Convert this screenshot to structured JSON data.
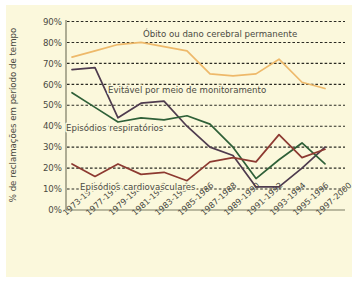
{
  "figure": {
    "background_color": "#fbf8dc",
    "border_color": "#ffffff"
  },
  "chart_data": {
    "type": "line",
    "title": "",
    "xlabel": "",
    "ylabel": "% de reclamações  em período de tempo",
    "ylim": [
      0,
      90
    ],
    "yticks": [
      0,
      10,
      20,
      30,
      40,
      50,
      60,
      70,
      80,
      90
    ],
    "ytick_labels": [
      "0%",
      "10%",
      "20%",
      "30%",
      "40%",
      "50%",
      "60%",
      "70%",
      "80%",
      "90%"
    ],
    "grid": true,
    "legend": "none (inline annotations)",
    "categories": [
      "1973-1976",
      "1977-1978",
      "1979-1980",
      "1981-1982",
      "1983-1984",
      "1985-1986",
      "1987-1988",
      "1989-1990",
      "1991-1992",
      "1993-1994",
      "1995-1996",
      "1997-2000"
    ],
    "series": [
      {
        "name": "Óbito ou dano cerebral permanente",
        "color": "#eeb96a",
        "values": [
          73,
          76,
          79,
          80,
          78,
          76,
          65,
          64,
          65,
          72,
          61,
          58
        ]
      },
      {
        "name": "Evitável por meio de monitoramento",
        "color": "#4e3b4e",
        "values": [
          67,
          68,
          44,
          51,
          52,
          40,
          30,
          26,
          11,
          11,
          20,
          30
        ]
      },
      {
        "name": "Episódios respiratórios",
        "color": "#2f6038",
        "values": [
          56,
          49,
          42,
          44,
          43,
          45,
          41,
          30,
          15,
          24,
          32,
          22
        ]
      },
      {
        "name": "Episódios cardiovasculares",
        "color": "#8d3a31",
        "values": [
          22,
          16,
          22,
          17,
          18,
          14,
          23,
          25,
          23,
          36,
          25,
          29
        ]
      }
    ],
    "annotations": [
      {
        "text": "Óbito ou dano cerebral permanente",
        "x_px": 143,
        "y_px": 37,
        "series": "Óbito ou dano cerebral permanente"
      },
      {
        "text": "Evitável por meio de monitoramento",
        "x_px": 108,
        "y_px": 93,
        "series": "Evitável por meio de monitoramento"
      },
      {
        "text": "Episódios respiratórios",
        "x_px": 66,
        "y_px": 131,
        "series": "Episódios respiratórios"
      },
      {
        "text": "Episódios cardiovasculares",
        "x_px": 80,
        "y_px": 190,
        "series": "Episódios cardiovasculares"
      }
    ]
  }
}
